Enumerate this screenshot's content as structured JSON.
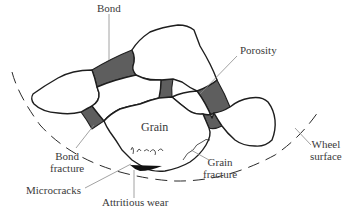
{
  "diagram": {
    "labels": {
      "bond": "Bond",
      "porosity": "Porosity",
      "grain": "Grain",
      "bond_fracture_line1": "Bond",
      "bond_fracture_line2": "fracture",
      "grain_fracture_line1": "Grain",
      "grain_fracture_line2": "fracture",
      "wheel_surface_line1": "Wheel",
      "wheel_surface_line2": "surface",
      "microcracks": "Microcracks",
      "attritious_wear": "Attritious wear"
    },
    "colors": {
      "bond_fill": "#5e5e5e",
      "outline": "#1e1e1e",
      "label_text": "#3a3a3a",
      "leader_line": "#8a8a8a",
      "background": "#ffffff"
    }
  }
}
